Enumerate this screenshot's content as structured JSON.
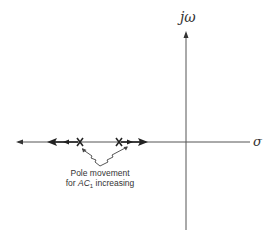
{
  "diagram": {
    "type": "s-plane pole movement",
    "axes": {
      "vertical_label": "jω",
      "horizontal_label": "σ"
    },
    "poles": [
      {
        "id": "pole-left",
        "symbol": "X"
      },
      {
        "id": "pole-right",
        "symbol": "X"
      }
    ],
    "annotation": {
      "line1": "Pole movement",
      "line2_prefix": "for ",
      "line2_var": "AC",
      "line2_sub": "1",
      "line2_suffix": " increasing"
    },
    "colors": {
      "stroke": "#333333",
      "background": "#ffffff"
    }
  }
}
